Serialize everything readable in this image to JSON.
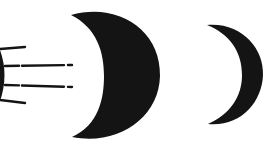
{
  "figure": {
    "colors": {
      "background": "#ffffff",
      "ink": "#141414"
    },
    "elements": [
      {
        "id": "light-source",
        "kind": "partial-disc",
        "label": ""
      },
      {
        "id": "large-crescent",
        "kind": "crescent",
        "label": ""
      },
      {
        "id": "small-crescent",
        "kind": "crescent",
        "label": ""
      }
    ]
  }
}
